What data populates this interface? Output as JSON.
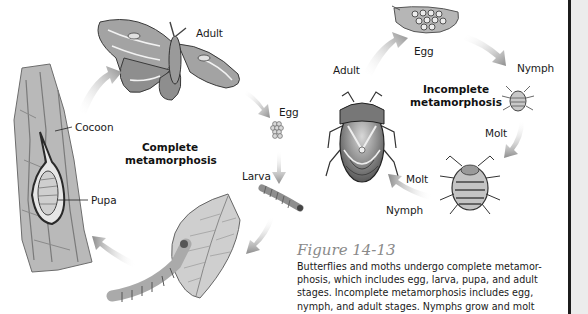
{
  "complete_cycle": {
    "title_line1": "Complete",
    "title_line2": "metamorphosis",
    "labels": {
      "adult": "Adult",
      "egg": "Egg",
      "larva": "Larva",
      "cocoon": "Cocoon",
      "pupa": "Pupa"
    }
  },
  "incomplete_cycle": {
    "title_line1": "Incomplete",
    "title_line2": "metamorphosis",
    "labels": {
      "egg": "Egg",
      "nymph_top": "Nymph",
      "molt_right": "Molt",
      "molt_bottom": "Molt",
      "nymph_bottom": "Nymph",
      "adult": "Adult"
    }
  },
  "figure": {
    "title": "Figure 14-13",
    "caption_lines": [
      "Butterflies and moths undergo complete metamor-",
      "phosis, which includes egg, larva, pupa, and adult",
      "stages. Incomplete metamorphosis includes egg,",
      "nymph, and adult stages. Nymphs grow and molt"
    ]
  },
  "colors": {
    "arrow": "#8c8c8c",
    "figure_title": "#8a8a8a",
    "text": "#1a1a1a",
    "side_strip": "#ececec"
  }
}
